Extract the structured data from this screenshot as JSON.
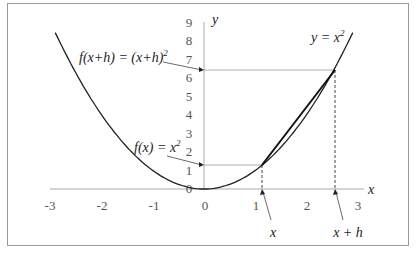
{
  "chart_data": {
    "type": "line",
    "title": "",
    "xlabel": "x",
    "ylabel": "y",
    "xlim": [
      -3,
      3
    ],
    "ylim": [
      0,
      9
    ],
    "x_ticks": [
      "-3",
      "-2",
      "-1",
      "0",
      "1",
      "2",
      "3"
    ],
    "y_ticks": [
      "0",
      "1",
      "2",
      "3",
      "4",
      "5",
      "6",
      "7",
      "8",
      "9"
    ],
    "grid": false,
    "series": [
      {
        "name": "y = x^2",
        "function": "x^2",
        "domain": [
          -3,
          3
        ]
      },
      {
        "name": "secant",
        "points": [
          [
            1.13,
            1.28
          ],
          [
            2.55,
            6.5
          ]
        ]
      }
    ],
    "points": {
      "x": {
        "x": 1.13,
        "y": 1.28
      },
      "x_plus_h": {
        "x": 2.55,
        "y": 6.5
      }
    }
  },
  "labels": {
    "curve": {
      "lhs": "y",
      "eq": " = ",
      "base": "x",
      "exp": "2"
    },
    "fx": {
      "lhs": "f(x)",
      "eq": " = ",
      "base": "x",
      "exp": "2"
    },
    "fxh": {
      "lhs": "f(x+h)",
      "eq": " = ",
      "base": "(x+h)",
      "exp": "2"
    },
    "x_point": "x",
    "xh_point": "x + h",
    "x_axis": "x",
    "y_axis": "y"
  },
  "colors": {
    "curve": "#222222",
    "axis": "#aaaaaa",
    "guide": "#999999",
    "dashed": "#666666",
    "frame": "#9a9a9a"
  }
}
